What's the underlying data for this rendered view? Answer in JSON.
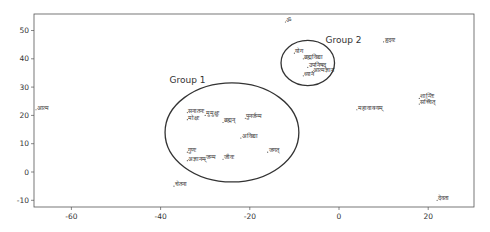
{
  "chart_data": {
    "type": "scatter",
    "title": "",
    "xlabel": "",
    "ylabel": "",
    "xlim": [
      -68,
      31
    ],
    "ylim": [
      -13,
      56
    ],
    "grid": false,
    "x_ticks": [
      -60,
      -40,
      -20,
      0,
      20
    ],
    "x_tick_labels": [
      "-60",
      "-40",
      "-20",
      "0",
      "20"
    ],
    "y_ticks": [
      50,
      40,
      30,
      20,
      10,
      0,
      -10
    ],
    "y_tick_labels": [
      "50",
      "40",
      "30",
      "20",
      "10",
      "0",
      "-10"
    ],
    "points": [
      {
        "label": "ॐ",
        "x": -12,
        "y": 53
      },
      {
        "label": "हृदयः",
        "x": 10,
        "y": 46
      },
      {
        "label": "योग",
        "x": -10,
        "y": 42
      },
      {
        "label": "ब्रह्मविद्या",
        "x": -8,
        "y": 40
      },
      {
        "label": "उपनिषद्",
        "x": -7,
        "y": 37
      },
      {
        "label": "आत्मज्ञान",
        "x": -6,
        "y": 35.5
      },
      {
        "label": "ध्यान",
        "x": -8,
        "y": 34
      },
      {
        "label": "शान्तिः",
        "x": 18,
        "y": 26
      },
      {
        "label": "सच्चित्",
        "x": 18,
        "y": 24
      },
      {
        "label": "महावाक्यम्",
        "x": 4,
        "y": 22
      },
      {
        "label": "आत्म",
        "x": -68,
        "y": 22
      },
      {
        "label": "सनातनः",
        "x": -34,
        "y": 21
      },
      {
        "label": "मुमुक्षुः",
        "x": -30,
        "y": 20
      },
      {
        "label": "मोक्षः",
        "x": -34,
        "y": 18.5
      },
      {
        "label": "ब्रह्मन्",
        "x": -26,
        "y": 17.5
      },
      {
        "label": "पुनर्जन्म",
        "x": -21,
        "y": 19
      },
      {
        "label": "अविद्या",
        "x": -22,
        "y": 12
      },
      {
        "label": "गुणः",
        "x": -34,
        "y": 7
      },
      {
        "label": "अज्ञानम्",
        "x": -34,
        "y": 4
      },
      {
        "label": "जन्म",
        "x": -30,
        "y": 4.5
      },
      {
        "label": "जीवः",
        "x": -26,
        "y": 4.5
      },
      {
        "label": "जगत्",
        "x": -16,
        "y": 7
      },
      {
        "label": "चेतना",
        "x": -37,
        "y": -5
      },
      {
        "label": "देवता",
        "x": 22,
        "y": -10
      }
    ],
    "annotations": [
      {
        "text": "Group 1",
        "x": -38,
        "y": 31.5
      },
      {
        "text": "Group 2",
        "x": -3,
        "y": 45.5
      }
    ],
    "groups": [
      {
        "name": "Group 1",
        "shape": "ellipse",
        "cx": -24,
        "cy": 14,
        "rx": 15,
        "ry": 17.5
      },
      {
        "name": "Group 2",
        "shape": "ellipse",
        "cx": -7,
        "cy": 38.5,
        "rx": 6,
        "ry": 8
      }
    ]
  },
  "colors": {
    "axis": "#555555",
    "text": "#333333",
    "circle": "#333333",
    "background": "#ffffff"
  }
}
